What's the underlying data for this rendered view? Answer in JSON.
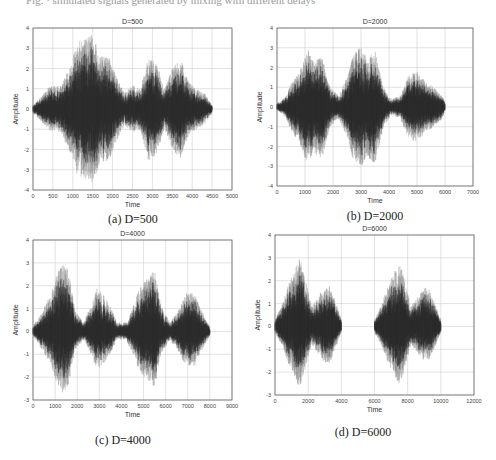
{
  "figure": {
    "caption_top_cutoff": "Fig. · simulated signals generated by mixing with different delays"
  },
  "chart_data": [
    {
      "type": "line",
      "id": "a",
      "title": "D=500",
      "caption": "(a) D=500",
      "xlabel": "Time",
      "ylabel": "Amplitude",
      "xlim": [
        0,
        5000
      ],
      "ylim": [
        -4,
        4
      ],
      "xticks": [
        0,
        500,
        1000,
        1500,
        2000,
        2500,
        3000,
        3500,
        4000,
        4500,
        5000
      ],
      "yticks": [
        -4,
        -3,
        -2,
        -1,
        0,
        1,
        2,
        3,
        4
      ],
      "grid": true,
      "signal_range": [
        0,
        4500
      ],
      "envelope": [
        [
          0,
          0.2
        ],
        [
          200,
          0.6
        ],
        [
          400,
          1.1
        ],
        [
          700,
          1.2
        ],
        [
          900,
          2.0
        ],
        [
          1100,
          3.2
        ],
        [
          1300,
          3.6
        ],
        [
          1500,
          3.7
        ],
        [
          1700,
          2.6
        ],
        [
          1900,
          2.6
        ],
        [
          2100,
          1.6
        ],
        [
          2300,
          0.8
        ],
        [
          2500,
          1.2
        ],
        [
          2700,
          1.0
        ],
        [
          2900,
          2.6
        ],
        [
          3100,
          2.3
        ],
        [
          3300,
          1.0
        ],
        [
          3500,
          2.0
        ],
        [
          3700,
          2.5
        ],
        [
          3900,
          1.4
        ],
        [
          4100,
          1.0
        ],
        [
          4300,
          0.8
        ],
        [
          4500,
          0.2
        ]
      ],
      "peaks": {
        "max": 3.7,
        "min": -3.7
      }
    },
    {
      "type": "line",
      "id": "b",
      "title": "D=2000",
      "caption": "(b) D=2000",
      "xlabel": "Time",
      "ylabel": "Amplitude",
      "xlim": [
        0,
        7000
      ],
      "ylim": [
        -4,
        4
      ],
      "xticks": [
        0,
        1000,
        2000,
        3000,
        4000,
        5000,
        6000,
        7000
      ],
      "yticks": [
        -4,
        -3,
        -2,
        -1,
        0,
        1,
        2,
        3,
        4
      ],
      "grid": true,
      "signal_range": [
        0,
        6000
      ],
      "envelope": [
        [
          0,
          0.2
        ],
        [
          300,
          0.5
        ],
        [
          500,
          1.2
        ],
        [
          800,
          1.8
        ],
        [
          1100,
          3.0
        ],
        [
          1300,
          2.3
        ],
        [
          1600,
          2.7
        ],
        [
          1900,
          1.0
        ],
        [
          2200,
          0.6
        ],
        [
          2500,
          1.5
        ],
        [
          2700,
          2.6
        ],
        [
          3000,
          3.1
        ],
        [
          3200,
          2.5
        ],
        [
          3500,
          2.9
        ],
        [
          3800,
          1.0
        ],
        [
          4100,
          0.4
        ],
        [
          4400,
          0.6
        ],
        [
          4700,
          1.6
        ],
        [
          5000,
          1.8
        ],
        [
          5300,
          1.3
        ],
        [
          5600,
          1.0
        ],
        [
          5900,
          0.6
        ],
        [
          6000,
          0.2
        ]
      ],
      "peaks": {
        "max": 3.1,
        "min": -3.1
      }
    },
    {
      "type": "line",
      "id": "c",
      "title": "D=4000",
      "caption": "(c) D=4000",
      "xlabel": "Time",
      "ylabel": "Amplitude",
      "xlim": [
        0,
        9000
      ],
      "ylim": [
        -3,
        4
      ],
      "xticks": [
        0,
        1000,
        2000,
        3000,
        4000,
        5000,
        6000,
        7000,
        8000,
        9000
      ],
      "yticks": [
        -3,
        -2,
        -1,
        0,
        1,
        2,
        3,
        4
      ],
      "grid": true,
      "signal_range": [
        0,
        8000
      ],
      "envelope": [
        [
          0,
          0.2
        ],
        [
          400,
          0.9
        ],
        [
          800,
          1.6
        ],
        [
          1100,
          2.6
        ],
        [
          1300,
          3.0
        ],
        [
          1600,
          2.7
        ],
        [
          1900,
          0.9
        ],
        [
          2300,
          0.4
        ],
        [
          2600,
          1.1
        ],
        [
          2900,
          1.9
        ],
        [
          3200,
          1.6
        ],
        [
          3500,
          1.1
        ],
        [
          3800,
          0.4
        ],
        [
          4200,
          0.4
        ],
        [
          4600,
          1.3
        ],
        [
          4900,
          2.2
        ],
        [
          5200,
          2.4
        ],
        [
          5500,
          2.7
        ],
        [
          5800,
          1.1
        ],
        [
          6200,
          0.4
        ],
        [
          6600,
          1.0
        ],
        [
          6900,
          1.7
        ],
        [
          7300,
          1.7
        ],
        [
          7600,
          1.0
        ],
        [
          8000,
          0.2
        ]
      ],
      "peaks": {
        "max": 3.0,
        "min": -2.7
      }
    },
    {
      "type": "line",
      "id": "d",
      "title": "D=6000",
      "caption": "(d) D=6000",
      "xlabel": "Time",
      "ylabel": "Amplitude",
      "xlim": [
        0,
        12000
      ],
      "ylim": [
        -3,
        4
      ],
      "xticks": [
        0,
        2000,
        4000,
        6000,
        8000,
        10000,
        12000
      ],
      "yticks": [
        -3,
        -2,
        -1,
        0,
        1,
        2,
        3,
        4
      ],
      "grid": true,
      "signal_range": [
        0,
        10000
      ],
      "silent_gap": [
        4000,
        6000
      ],
      "envelope": [
        [
          0,
          0.3
        ],
        [
          400,
          0.9
        ],
        [
          800,
          1.8
        ],
        [
          1200,
          2.6
        ],
        [
          1500,
          3.0
        ],
        [
          1800,
          2.2
        ],
        [
          2200,
          0.9
        ],
        [
          2600,
          1.3
        ],
        [
          3000,
          1.8
        ],
        [
          3300,
          1.8
        ],
        [
          3700,
          1.0
        ],
        [
          4000,
          0.3
        ],
        [
          4001,
          0
        ],
        [
          5999,
          0
        ],
        [
          6000,
          0.3
        ],
        [
          6400,
          0.9
        ],
        [
          6800,
          1.8
        ],
        [
          7200,
          2.4
        ],
        [
          7500,
          2.8
        ],
        [
          7800,
          2.2
        ],
        [
          8200,
          0.9
        ],
        [
          8600,
          1.3
        ],
        [
          9000,
          1.7
        ],
        [
          9300,
          1.6
        ],
        [
          9700,
          0.9
        ],
        [
          10000,
          0.3
        ]
      ],
      "peaks": {
        "max": 3.0,
        "min": -2.7
      }
    }
  ],
  "colors": {
    "signal_dark": "#2a2a2a",
    "signal_light": "#8a8a8a",
    "grid": "#cfcfcf",
    "axis": "#555555"
  }
}
